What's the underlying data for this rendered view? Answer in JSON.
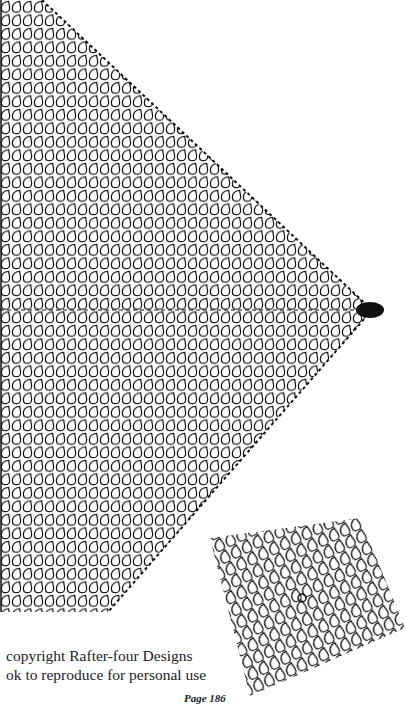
{
  "page": {
    "copyright_line1": "copyright Rafter-four Designs",
    "copyright_line2": "ok to reproduce for personal use",
    "page_number": "Page 186"
  },
  "chart": {
    "stitch_symbol": "teardrop-loop-icon",
    "shape": "half-diamond pointing right",
    "apex": {
      "x": 370,
      "y": 310
    },
    "top": {
      "x": 40,
      "y": 0
    },
    "bottom": {
      "x": 110,
      "y": 610
    },
    "ink_color": "#111111",
    "paper_color": "#ffffff"
  },
  "motif": {
    "shape": "rotated square",
    "center": {
      "x": 300,
      "y": 610
    },
    "stitch_symbol": "teardrop-loop-icon"
  }
}
